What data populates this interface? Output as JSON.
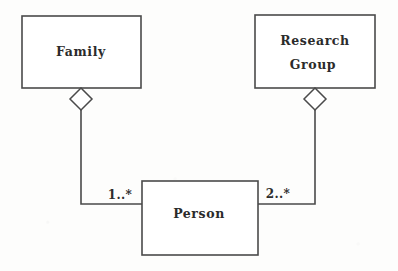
{
  "diagram": {
    "type": "uml-class-diagram",
    "notation": "aggregation",
    "background_color": "#fdfdfc",
    "stroke_color": "#4a4a4a",
    "text_color": "#2b2b2b",
    "classes": [
      {
        "id": "family",
        "name": "Family",
        "name_lines": [
          "Family"
        ],
        "x": 22,
        "y": 16,
        "width": 119,
        "height": 72
      },
      {
        "id": "research-group",
        "name": "Research Group",
        "name_lines": [
          "Research",
          "Group"
        ],
        "x": 255,
        "y": 15,
        "width": 120,
        "height": 73
      },
      {
        "id": "person",
        "name": "Person",
        "name_lines": [
          "Person"
        ],
        "x": 142,
        "y": 181,
        "width": 116,
        "height": 74
      }
    ],
    "associations": [
      {
        "id": "family-person",
        "from": "family",
        "to": "person",
        "kind": "aggregation",
        "diamond_at": "family",
        "multiplicity_label": "1..*",
        "multiplicity_x": 120,
        "multiplicity_y": 195,
        "diamond_cx": 81,
        "diamond_cy": 99,
        "diamond_rx": 11,
        "diamond_ry": 11,
        "path": "M 81 110 L 81 204 L 142 204"
      },
      {
        "id": "researchgroup-person",
        "from": "research-group",
        "to": "person",
        "kind": "aggregation",
        "diamond_at": "research-group",
        "multiplicity_label": "2..*",
        "multiplicity_x": 278,
        "multiplicity_y": 194,
        "diamond_cx": 315,
        "diamond_cy": 99,
        "diamond_rx": 11,
        "diamond_ry": 11,
        "path": "M 315 110 L 315 204 L 258 204"
      }
    ]
  }
}
